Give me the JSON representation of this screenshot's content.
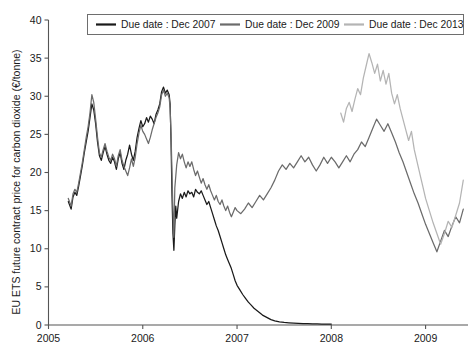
{
  "chart_data": {
    "type": "line",
    "title": "",
    "xlabel": "",
    "ylabel": "EU ETS future contract price for carbon dioxide (€/tonne)",
    "xlim": [
      2005.0,
      2009.45
    ],
    "ylim": [
      0,
      40
    ],
    "xticks": [
      "2005",
      "2006",
      "2007",
      "2008",
      "2009"
    ],
    "xtick_values": [
      2005,
      2006,
      2007,
      2008,
      2009
    ],
    "yticks": [
      "0",
      "5",
      "10",
      "15",
      "20",
      "25",
      "30",
      "35",
      "40"
    ],
    "ytick_values": [
      0,
      5,
      10,
      15,
      20,
      25,
      30,
      35,
      40
    ],
    "grid": false,
    "legend_position": "top-center",
    "series": [
      {
        "name": "Due date : Dec 2007",
        "color": "#1a1a1a",
        "x": [
          2005.21,
          2005.24,
          2005.26,
          2005.28,
          2005.3,
          2005.32,
          2005.34,
          2005.36,
          2005.38,
          2005.4,
          2005.42,
          2005.44,
          2005.46,
          2005.48,
          2005.5,
          2005.52,
          2005.54,
          2005.56,
          2005.58,
          2005.6,
          2005.62,
          2005.64,
          2005.66,
          2005.68,
          2005.7,
          2005.72,
          2005.74,
          2005.76,
          2005.78,
          2005.8,
          2005.82,
          2005.84,
          2005.86,
          2005.88,
          2005.9,
          2005.92,
          2005.94,
          2005.96,
          2005.98,
          2006.0,
          2006.02,
          2006.04,
          2006.06,
          2006.08,
          2006.1,
          2006.12,
          2006.14,
          2006.16,
          2006.18,
          2006.2,
          2006.22,
          2006.24,
          2006.26,
          2006.28,
          2006.29,
          2006.3,
          2006.31,
          2006.32,
          2006.33,
          2006.34,
          2006.35,
          2006.36,
          2006.38,
          2006.4,
          2006.42,
          2006.44,
          2006.46,
          2006.48,
          2006.5,
          2006.52,
          2006.54,
          2006.56,
          2006.58,
          2006.6,
          2006.62,
          2006.64,
          2006.66,
          2006.68,
          2006.7,
          2006.72,
          2006.74,
          2006.76,
          2006.78,
          2006.8,
          2006.82,
          2006.84,
          2006.86,
          2006.88,
          2006.9,
          2006.92,
          2006.94,
          2006.96,
          2006.98,
          2007.0,
          2007.03,
          2007.06,
          2007.09,
          2007.12,
          2007.15,
          2007.18,
          2007.21,
          2007.24,
          2007.27,
          2007.3,
          2007.33,
          2007.36,
          2007.4,
          2007.45,
          2007.5,
          2007.55,
          2007.6,
          2007.65,
          2007.7,
          2007.75,
          2007.8,
          2007.85,
          2007.9,
          2007.95,
          2008.0
        ],
        "y": [
          16.2,
          15.2,
          16.8,
          17.4,
          17.0,
          18.2,
          19.6,
          21.0,
          22.6,
          24.0,
          25.4,
          27.2,
          29.0,
          28.2,
          26.4,
          24.0,
          22.2,
          21.6,
          22.6,
          23.4,
          22.4,
          21.6,
          21.2,
          22.0,
          21.4,
          20.4,
          21.8,
          22.6,
          21.2,
          20.4,
          21.6,
          22.4,
          23.6,
          22.4,
          21.6,
          22.8,
          24.6,
          25.8,
          26.8,
          26.0,
          26.4,
          27.2,
          26.6,
          27.4,
          27.0,
          26.4,
          27.6,
          28.2,
          29.0,
          30.6,
          31.2,
          30.4,
          30.8,
          30.2,
          29.0,
          24.0,
          17.0,
          12.0,
          9.8,
          13.0,
          15.6,
          14.0,
          16.2,
          17.2,
          16.6,
          17.4,
          16.8,
          17.6,
          17.2,
          17.4,
          16.8,
          17.8,
          17.4,
          17.2,
          17.6,
          17.0,
          16.4,
          15.8,
          16.2,
          15.4,
          14.6,
          13.8,
          13.0,
          12.4,
          11.6,
          10.8,
          10.0,
          9.2,
          8.6,
          8.0,
          7.4,
          6.6,
          5.8,
          5.2,
          4.6,
          4.0,
          3.5,
          3.0,
          2.6,
          2.2,
          1.9,
          1.6,
          1.3,
          1.1,
          0.9,
          0.7,
          0.55,
          0.42,
          0.33,
          0.28,
          0.24,
          0.21,
          0.19,
          0.17,
          0.15,
          0.14,
          0.13,
          0.12,
          0.12
        ]
      },
      {
        "name": "Due date : Dec 2009",
        "color": "#6b6b6b",
        "x": [
          2005.21,
          2005.24,
          2005.26,
          2005.28,
          2005.3,
          2005.32,
          2005.34,
          2005.36,
          2005.38,
          2005.4,
          2005.42,
          2005.44,
          2005.46,
          2005.48,
          2005.5,
          2005.52,
          2005.54,
          2005.56,
          2005.58,
          2005.6,
          2005.62,
          2005.64,
          2005.66,
          2005.68,
          2005.7,
          2005.72,
          2005.74,
          2005.76,
          2005.78,
          2005.8,
          2005.82,
          2005.84,
          2005.86,
          2005.88,
          2005.9,
          2005.92,
          2005.94,
          2005.96,
          2005.98,
          2006.0,
          2006.02,
          2006.04,
          2006.06,
          2006.08,
          2006.1,
          2006.12,
          2006.14,
          2006.16,
          2006.18,
          2006.2,
          2006.22,
          2006.24,
          2006.26,
          2006.28,
          2006.29,
          2006.3,
          2006.31,
          2006.32,
          2006.33,
          2006.34,
          2006.36,
          2006.38,
          2006.4,
          2006.42,
          2006.44,
          2006.46,
          2006.48,
          2006.5,
          2006.52,
          2006.54,
          2006.56,
          2006.58,
          2006.6,
          2006.62,
          2006.64,
          2006.66,
          2006.68,
          2006.7,
          2006.72,
          2006.74,
          2006.76,
          2006.78,
          2006.8,
          2006.82,
          2006.84,
          2006.86,
          2006.88,
          2006.9,
          2006.92,
          2006.94,
          2006.96,
          2006.98,
          2007.0,
          2007.04,
          2007.08,
          2007.12,
          2007.16,
          2007.2,
          2007.24,
          2007.28,
          2007.32,
          2007.36,
          2007.4,
          2007.44,
          2007.48,
          2007.52,
          2007.56,
          2007.6,
          2007.64,
          2007.68,
          2007.72,
          2007.76,
          2007.8,
          2007.84,
          2007.88,
          2007.92,
          2007.96,
          2008.0,
          2008.04,
          2008.08,
          2008.12,
          2008.16,
          2008.2,
          2008.24,
          2008.28,
          2008.32,
          2008.36,
          2008.4,
          2008.44,
          2008.48,
          2008.52,
          2008.56,
          2008.6,
          2008.64,
          2008.68,
          2008.72,
          2008.76,
          2008.8,
          2008.84,
          2008.88,
          2008.92,
          2008.96,
          2009.0,
          2009.04,
          2009.08,
          2009.12,
          2009.16,
          2009.2,
          2009.24,
          2009.28,
          2009.32,
          2009.36,
          2009.4
        ],
        "y": [
          16.6,
          15.6,
          17.2,
          17.8,
          17.4,
          18.6,
          20.0,
          21.4,
          23.0,
          24.6,
          26.0,
          27.8,
          30.2,
          29.2,
          27.0,
          24.6,
          22.6,
          22.0,
          23.0,
          23.8,
          22.8,
          22.0,
          21.6,
          22.4,
          21.8,
          20.8,
          22.2,
          23.0,
          21.6,
          20.8,
          20.2,
          19.6,
          20.6,
          21.8,
          20.8,
          22.0,
          23.8,
          25.2,
          26.2,
          25.4,
          25.0,
          24.4,
          23.8,
          24.6,
          25.6,
          26.4,
          27.2,
          27.8,
          28.6,
          30.2,
          30.8,
          30.0,
          30.4,
          29.8,
          28.4,
          25.0,
          20.0,
          15.0,
          11.5,
          18.0,
          21.0,
          22.6,
          21.8,
          22.4,
          21.4,
          20.6,
          21.4,
          20.8,
          21.4,
          20.4,
          19.6,
          20.2,
          19.4,
          18.6,
          19.2,
          18.4,
          17.8,
          18.4,
          17.6,
          17.0,
          16.4,
          17.0,
          16.2,
          15.8,
          16.4,
          15.6,
          15.0,
          15.6,
          14.8,
          14.2,
          14.8,
          15.4,
          15.0,
          14.6,
          15.2,
          16.0,
          15.4,
          16.2,
          17.0,
          16.4,
          17.2,
          18.0,
          19.0,
          20.2,
          21.0,
          20.4,
          21.2,
          20.6,
          21.4,
          22.2,
          21.4,
          22.0,
          21.0,
          20.2,
          21.0,
          22.0,
          21.2,
          22.0,
          21.4,
          20.6,
          21.4,
          22.2,
          21.4,
          22.4,
          23.0,
          24.0,
          23.4,
          24.6,
          25.8,
          27.0,
          26.2,
          25.4,
          26.4,
          25.2,
          24.0,
          22.6,
          21.4,
          20.0,
          18.6,
          17.2,
          16.0,
          14.6,
          13.2,
          12.0,
          10.8,
          9.6,
          11.0,
          12.4,
          11.6,
          13.0,
          14.2,
          13.4,
          15.2
        ]
      },
      {
        "name": "Due date : Dec 2013",
        "color": "#b4b4b4",
        "x": [
          2008.1,
          2008.13,
          2008.16,
          2008.19,
          2008.22,
          2008.25,
          2008.28,
          2008.31,
          2008.34,
          2008.37,
          2008.4,
          2008.43,
          2008.46,
          2008.49,
          2008.52,
          2008.55,
          2008.58,
          2008.61,
          2008.64,
          2008.67,
          2008.7,
          2008.73,
          2008.76,
          2008.79,
          2008.82,
          2008.85,
          2008.88,
          2008.91,
          2008.94,
          2008.97,
          2009.0,
          2009.04,
          2009.08,
          2009.12,
          2009.16,
          2009.2,
          2009.24,
          2009.28,
          2009.32,
          2009.36,
          2009.4
        ],
        "y": [
          27.8,
          26.6,
          28.4,
          29.2,
          28.0,
          29.6,
          31.0,
          30.2,
          32.4,
          34.0,
          35.6,
          34.4,
          33.0,
          34.2,
          32.0,
          33.4,
          31.6,
          33.0,
          30.4,
          29.0,
          30.2,
          28.4,
          27.0,
          25.6,
          24.2,
          25.4,
          23.0,
          21.4,
          19.8,
          18.2,
          16.6,
          15.0,
          13.4,
          12.0,
          10.6,
          12.0,
          13.6,
          12.8,
          14.4,
          16.0,
          19.0
        ]
      }
    ]
  },
  "legend": {
    "items": [
      {
        "label": "Due date : Dec 2007",
        "color": "#1a1a1a"
      },
      {
        "label": "Due date : Dec 2009",
        "color": "#6b6b6b"
      },
      {
        "label": "Due date : Dec 2013",
        "color": "#b4b4b4"
      }
    ]
  }
}
